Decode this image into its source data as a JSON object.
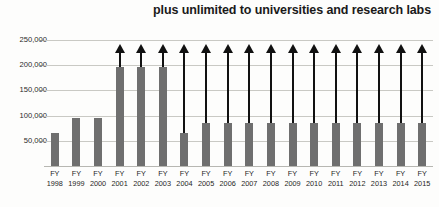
{
  "chart_data": {
    "type": "bar",
    "title": "plus unlimited to universities and research labs",
    "xlabel": "",
    "ylabel": "",
    "ylim": [
      0,
      250000
    ],
    "grid": true,
    "legend": "none",
    "y_ticks": [
      "50,000",
      "100,000",
      "150,000",
      "200,000",
      "250,000"
    ],
    "y_tick_values": [
      50000,
      100000,
      150000,
      200000,
      250000
    ],
    "categories": [
      "FY 1998",
      "FY 1999",
      "FY 2000",
      "FY 2001",
      "FY 2002",
      "FY 2003",
      "FY 2004",
      "FY 2005",
      "FY 2006",
      "FY 2007",
      "FY 2008",
      "FY 2009",
      "FY 2010",
      "FY 2011",
      "FY 2012",
      "FY 2013",
      "FY 2014",
      "FY 2015"
    ],
    "category_lines": [
      {
        "prefix": "FY",
        "year": "1998"
      },
      {
        "prefix": "FY",
        "year": "1999"
      },
      {
        "prefix": "FY",
        "year": "2000"
      },
      {
        "prefix": "FY",
        "year": "2001"
      },
      {
        "prefix": "FY",
        "year": "2002"
      },
      {
        "prefix": "FY",
        "year": "2003"
      },
      {
        "prefix": "FY",
        "year": "2004"
      },
      {
        "prefix": "FY",
        "year": "2005"
      },
      {
        "prefix": "FY",
        "year": "2006"
      },
      {
        "prefix": "FY",
        "year": "2007"
      },
      {
        "prefix": "FY",
        "year": "2008"
      },
      {
        "prefix": "FY",
        "year": "2009"
      },
      {
        "prefix": "FY",
        "year": "2010"
      },
      {
        "prefix": "FY",
        "year": "2011"
      },
      {
        "prefix": "FY",
        "year": "2012"
      },
      {
        "prefix": "FY",
        "year": "2013"
      },
      {
        "prefix": "FY",
        "year": "2014"
      },
      {
        "prefix": "FY",
        "year": "2015"
      }
    ],
    "values": [
      65000,
      95000,
      95000,
      197000,
      197000,
      197000,
      65000,
      85000,
      85000,
      85000,
      85000,
      85000,
      85000,
      85000,
      85000,
      85000,
      85000,
      85000
    ],
    "arrow_tops": [
      null,
      null,
      null,
      243000,
      243000,
      243000,
      243000,
      243000,
      243000,
      243000,
      243000,
      243000,
      243000,
      243000,
      243000,
      243000,
      243000,
      243000
    ],
    "annotation_note": "Upward arrows above bars from FY2001 onward indicate unlimited / uncapped values",
    "colors": {
      "bar": "#6f6f6f",
      "arrow": "#111111",
      "grid": "#c9c9c4",
      "text": "#1f1f1f",
      "background": "#fdfdfc"
    }
  }
}
